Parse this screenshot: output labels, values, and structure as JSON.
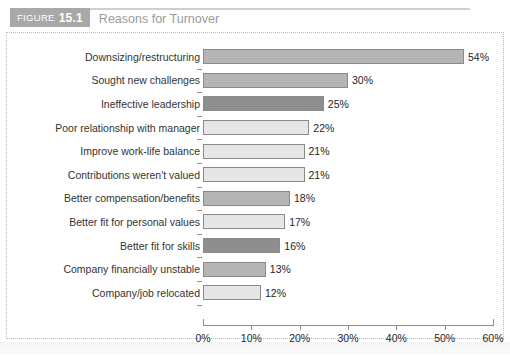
{
  "figure": {
    "badge_label": "FIGURE",
    "badge_number": "15.1",
    "title": "Reasons for Turnover",
    "badge_color": "#a8a8a8",
    "title_color": "#9a9a9a"
  },
  "chart_data": {
    "type": "bar",
    "orientation": "horizontal",
    "title": "Reasons for Turnover",
    "xlabel": "",
    "ylabel": "",
    "xlim": [
      0,
      60
    ],
    "xtick_labels": [
      "0%",
      "10%",
      "20%",
      "30%",
      "40%",
      "50%",
      "60%"
    ],
    "xticks": [
      0,
      10,
      20,
      30,
      40,
      50,
      60
    ],
    "grid": false,
    "legend": false,
    "categories": [
      "Downsizing/restructuring",
      "Sought new challenges",
      "Ineffective leadership",
      "Poor relationship with manager",
      "Improve work-life balance",
      "Contributions weren't valued",
      "Better compensation/benefits",
      "Better fit for personal values",
      "Better fit for skills",
      "Company financially unstable",
      "Company/job relocated"
    ],
    "values": [
      54,
      30,
      25,
      22,
      21,
      21,
      18,
      17,
      16,
      13,
      12
    ],
    "value_labels": [
      "54%",
      "30%",
      "25%",
      "22%",
      "21%",
      "21%",
      "18%",
      "17%",
      "16%",
      "13%",
      "12%"
    ],
    "bar_shades": [
      "shade-mid",
      "shade-mid",
      "shade-dark",
      "shade-lite",
      "shade-lite",
      "shade-lite",
      "shade-mid",
      "shade-lite",
      "shade-dark",
      "shade-mid",
      "shade-lite"
    ],
    "colors": {
      "mid": "#b5b5b5",
      "dark": "#8e8e8e",
      "lite": "#e6e6e6",
      "outline": "#8a8a8a"
    }
  }
}
